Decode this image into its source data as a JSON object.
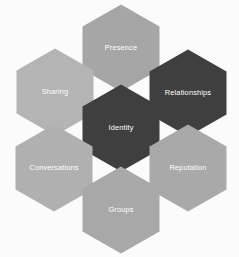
{
  "diagram": {
    "name": "social-media-honeycomb-framework",
    "type": "honeycomb-hexagon-diagram",
    "background_color": "#fbfbfb",
    "label_color": "#ffffff",
    "gap_color": "#fbfbfb",
    "cells": [
      {
        "id": "presence",
        "label": "Presence",
        "fill": "#a6a6a6",
        "tone": "medium",
        "position": "top-center",
        "cx": 121,
        "cy": 48
      },
      {
        "id": "sharing",
        "label": "Sharing",
        "fill": "#b4b4b4",
        "tone": "light",
        "position": "upper-left",
        "cx": 55,
        "cy": 92
      },
      {
        "id": "relationships",
        "label": "Relationships",
        "fill": "#3f3f3f",
        "tone": "dark",
        "position": "upper-right",
        "cx": 188,
        "cy": 93
      },
      {
        "id": "identity",
        "label": "Identity",
        "fill": "#3f3f3f",
        "tone": "dark",
        "position": "center",
        "cx": 121,
        "cy": 128
      },
      {
        "id": "conversations",
        "label": "Conversations",
        "fill": "#b0b0b0",
        "tone": "light",
        "position": "lower-left",
        "cx": 54,
        "cy": 168
      },
      {
        "id": "reputation",
        "label": "Reputation",
        "fill": "#a9a9a9",
        "tone": "medium",
        "position": "lower-right",
        "cx": 188,
        "cy": 168
      },
      {
        "id": "groups",
        "label": "Groups",
        "fill": "#a8a8a8",
        "tone": "medium",
        "position": "bottom-center",
        "cx": 121,
        "cy": 210
      }
    ]
  }
}
